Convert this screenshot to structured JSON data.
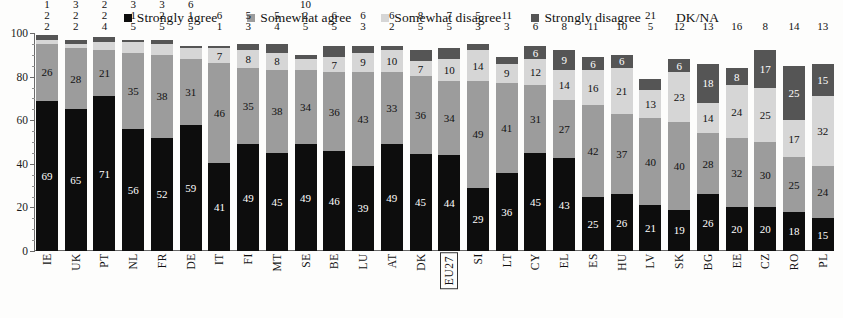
{
  "legend": {
    "items": [
      {
        "label": "Strongly agree",
        "color": "#0d0d0d",
        "key": "strongly_agree",
        "swatch": true
      },
      {
        "label": "Somewhat agree",
        "color": "#9c9c9c",
        "key": "somewhat_agree",
        "swatch": true
      },
      {
        "label": "Somewhat disagree",
        "color": "#d6d6d6",
        "key": "somewhat_disagree",
        "swatch": true
      },
      {
        "label": "Strongly disagree",
        "color": "#555555",
        "key": "strongly_disagree",
        "swatch": true
      },
      {
        "label": "DK/NA",
        "color": "#efefef",
        "key": "dk_na",
        "swatch": false
      }
    ]
  },
  "chart_data": {
    "type": "bar",
    "subtype": "stacked-percentage-column",
    "title": "",
    "xlabel": "",
    "ylabel": "",
    "ylim": [
      0,
      100
    ],
    "yticks": [
      0,
      20,
      40,
      60,
      80,
      100
    ],
    "grid": false,
    "legend_position": "top-center",
    "highlighted_category": "EU27",
    "categories": [
      "IE",
      "UK",
      "PT",
      "NL",
      "FR",
      "DE",
      "IT",
      "FI",
      "MT",
      "SE",
      "BE",
      "LU",
      "AT",
      "DK",
      "EU27",
      "SI",
      "LT",
      "CY",
      "EL",
      "ES",
      "HU",
      "LV",
      "SK",
      "BG",
      "EE",
      "CZ",
      "RO",
      "PL"
    ],
    "series": [
      {
        "name": "Strongly agree",
        "color": "#0d0d0d",
        "values": [
          69,
          65,
          71,
          56,
          52,
          59,
          41,
          49,
          45,
          49,
          46,
          39,
          49,
          45,
          44,
          29,
          36,
          45,
          43,
          25,
          26,
          21,
          19,
          26,
          20,
          20,
          18,
          15
        ]
      },
      {
        "name": "Somewhat agree",
        "color": "#9c9c9c",
        "values": [
          26,
          28,
          21,
          35,
          38,
          31,
          46,
          35,
          38,
          34,
          36,
          43,
          33,
          36,
          34,
          49,
          41,
          31,
          27,
          42,
          37,
          40,
          40,
          28,
          32,
          30,
          25,
          24
        ]
      },
      {
        "name": "Somewhat disagree",
        "color": "#d6d6d6",
        "values": [
          2,
          2,
          4,
          5,
          5,
          5,
          7,
          8,
          8,
          5,
          7,
          9,
          10,
          7,
          10,
          14,
          9,
          12,
          14,
          16,
          21,
          13,
          23,
          14,
          24,
          25,
          17,
          32
        ]
      },
      {
        "name": "Strongly disagree",
        "color": "#555555",
        "values": [
          2,
          2,
          2,
          1,
          2,
          1,
          1,
          3,
          4,
          2,
          5,
          3,
          2,
          5,
          5,
          3,
          3,
          6,
          9,
          6,
          6,
          5,
          6,
          18,
          8,
          17,
          25,
          15
        ]
      },
      {
        "name": "DK/NA",
        "color": "#efefef",
        "values": [
          1,
          3,
          2,
          3,
          3,
          6,
          6,
          5,
          5,
          10,
          6,
          6,
          6,
          8,
          7,
          5,
          11,
          6,
          8,
          11,
          10,
          21,
          12,
          13,
          16,
          8,
          14,
          13
        ]
      }
    ],
    "label_placement": {
      "inside": [
        "Strongly agree",
        "Somewhat agree",
        "Somewhat disagree",
        "Strongly disagree"
      ],
      "above_bar": [
        "DK/NA"
      ]
    },
    "note": "Values are percentages; each column sums to 100."
  }
}
